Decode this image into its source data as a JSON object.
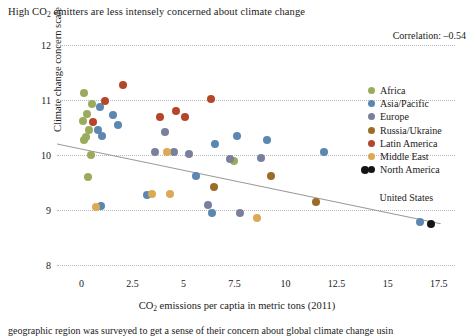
{
  "chart_data": {
    "type": "scatter",
    "title": "High CO2 emitters are less intensely concerned about climate change",
    "title_prefix": "High CO",
    "title_sub": "2",
    "title_suffix": " emitters are less intensely concerned about climate change",
    "correlation_label": "Correlation: –0.54",
    "correlation": -0.54,
    "xlabel_prefix": "CO",
    "xlabel_sub": "2",
    "xlabel_suffix": " emissions per captia in metric tons (2011)",
    "xlabel": "CO2 emissions per captia in metric tons (2011)",
    "ylabel": "Climate change concern scale",
    "xlim": [
      -1.2,
      18.3
    ],
    "ylim": [
      8,
      12
    ],
    "xticks": [
      0,
      2.5,
      5,
      7.5,
      10,
      12.5,
      15,
      17.5
    ],
    "xticklabels": [
      "0",
      "2.5",
      "5",
      "7.5",
      "10",
      "12.5",
      "15",
      "17.5"
    ],
    "yticks": [
      8,
      9,
      10,
      11,
      12
    ],
    "yticklabels": [
      "8",
      "9",
      "10",
      "11",
      "12"
    ],
    "grid": "horizontal-dotted",
    "legend_position": "right",
    "trendline": {
      "x0": -1.2,
      "y0": 10.2,
      "x1": 17.6,
      "y1": 8.75,
      "color": "#9a9a9a"
    },
    "annotations": [
      {
        "text": "United States",
        "x": 14.6,
        "y": 9.2
      }
    ],
    "series": [
      {
        "name": "Africa",
        "color": "#9aac5c",
        "points": [
          [
            0.1,
            11.13
          ],
          [
            0.07,
            10.62
          ],
          [
            0.25,
            10.75
          ],
          [
            0.35,
            10.45
          ],
          [
            0.2,
            10.32
          ],
          [
            0.12,
            10.28
          ],
          [
            0.45,
            10.0
          ],
          [
            0.3,
            9.6
          ],
          [
            7.45,
            9.9
          ],
          [
            0.5,
            10.92
          ]
        ]
      },
      {
        "name": "Asia/Pacific",
        "color": "#5b87b0",
        "points": [
          [
            0.9,
            10.88
          ],
          [
            1.55,
            10.72
          ],
          [
            1.8,
            10.55
          ],
          [
            0.95,
            9.08
          ],
          [
            3.2,
            9.28
          ],
          [
            5.6,
            9.62
          ],
          [
            6.55,
            10.2
          ],
          [
            7.6,
            10.35
          ],
          [
            9.1,
            10.28
          ],
          [
            11.9,
            10.05
          ],
          [
            6.4,
            8.95
          ],
          [
            16.6,
            8.78
          ],
          [
            1.0,
            10.35
          ],
          [
            0.8,
            10.45
          ]
        ]
      },
      {
        "name": "Europe",
        "color": "#7b7f9e",
        "points": [
          [
            4.1,
            10.42
          ],
          [
            4.55,
            10.05
          ],
          [
            5.25,
            10.02
          ],
          [
            7.3,
            9.92
          ],
          [
            6.2,
            9.1
          ],
          [
            7.75,
            8.95
          ],
          [
            8.8,
            9.95
          ],
          [
            3.6,
            10.05
          ]
        ]
      },
      {
        "name": "Russia/Ukraine",
        "color": "#9c6b28",
        "points": [
          [
            6.5,
            9.42
          ],
          [
            11.5,
            9.15
          ],
          [
            9.3,
            9.62
          ]
        ]
      },
      {
        "name": "Latin America",
        "color": "#b5462a",
        "points": [
          [
            2.05,
            11.28
          ],
          [
            1.15,
            10.98
          ],
          [
            3.85,
            10.7
          ],
          [
            4.65,
            10.8
          ],
          [
            5.05,
            10.7
          ],
          [
            6.35,
            11.02
          ],
          [
            0.55,
            10.6
          ]
        ]
      },
      {
        "name": "Middle East",
        "color": "#dcaa56",
        "points": [
          [
            0.7,
            9.05
          ],
          [
            3.45,
            9.3
          ],
          [
            4.35,
            9.3
          ],
          [
            8.6,
            8.85
          ],
          [
            4.2,
            10.05
          ]
        ]
      },
      {
        "name": "North America",
        "color": "#151515",
        "points": [
          [
            13.9,
            9.72
          ],
          [
            17.1,
            8.75
          ]
        ]
      }
    ]
  },
  "legend": {
    "items": [
      {
        "label": "Africa",
        "color": "#9aac5c"
      },
      {
        "label": "Asia/Pacific",
        "color": "#5b87b0"
      },
      {
        "label": "Europe",
        "color": "#7b7f9e"
      },
      {
        "label": "Russia/Ukraine",
        "color": "#9c6b28"
      },
      {
        "label": "Latin America",
        "color": "#b5462a"
      },
      {
        "label": "Middle East",
        "color": "#dcaa56"
      },
      {
        "label": "North America",
        "color": "#151515"
      }
    ]
  },
  "caption": "geographic region was surveyed to get a sense of their concern about global climate change usin"
}
